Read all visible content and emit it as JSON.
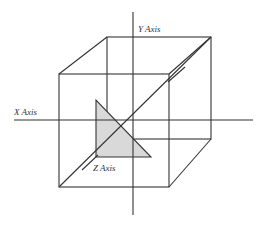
{
  "diagram": {
    "labels": {
      "x_axis": "X Axis",
      "y_axis": "Y Axis",
      "z_axis": "Z Axis"
    },
    "colors": {
      "line": "#333333",
      "triangle_fill": "#d9d9d9",
      "background": "#ffffff"
    }
  }
}
